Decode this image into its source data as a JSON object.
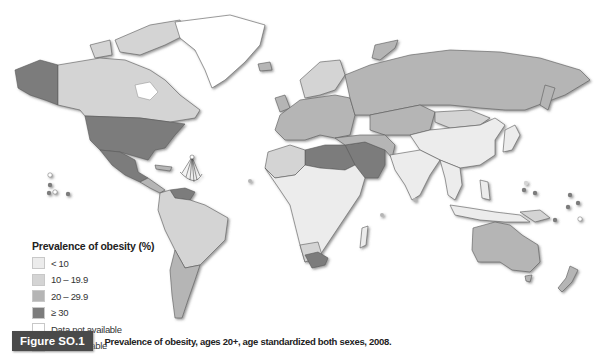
{
  "figure": {
    "label": "Figure SO.1",
    "caption": "Prevalence of obesity, ages 20+, age standardized both sexes, 2008."
  },
  "legend": {
    "title": "Prevalence of obesity (%)",
    "items": [
      {
        "label": "< 10",
        "color": "#ececec"
      },
      {
        "label": "10 – 19.9",
        "color": "#d4d4d4"
      },
      {
        "label": "20 – 29.9",
        "color": "#b5b5b5"
      },
      {
        "label": "≥ 30",
        "color": "#7c7c7c"
      },
      {
        "label": "Data not available",
        "color": "#ffffff"
      },
      {
        "label": "Not applicable",
        "color": "#bdbdbd"
      }
    ]
  },
  "map": {
    "regions": {
      "alaska": "#7c7c7c",
      "canada": "#d4d4d4",
      "greenland": "#ffffff",
      "usa": "#7c7c7c",
      "mexico": "#7c7c7c",
      "central_america": "#b5b5b5",
      "venezuela": "#7c7c7c",
      "south_america": "#d4d4d4",
      "argentina": "#b5b5b5",
      "europe": "#b5b5b5",
      "russia": "#b5b5b5",
      "north_africa": "#7c7c7c",
      "middle_east": "#7c7c7c",
      "central_asia": "#b5b5b5",
      "china": "#ececec",
      "india": "#ececec",
      "southeast_asia": "#ececec",
      "subsaharan_africa": "#ececec",
      "south_africa": "#7c7c7c",
      "australia": "#b5b5b5",
      "new_zealand": "#b5b5b5",
      "japan": "#ececec"
    }
  }
}
